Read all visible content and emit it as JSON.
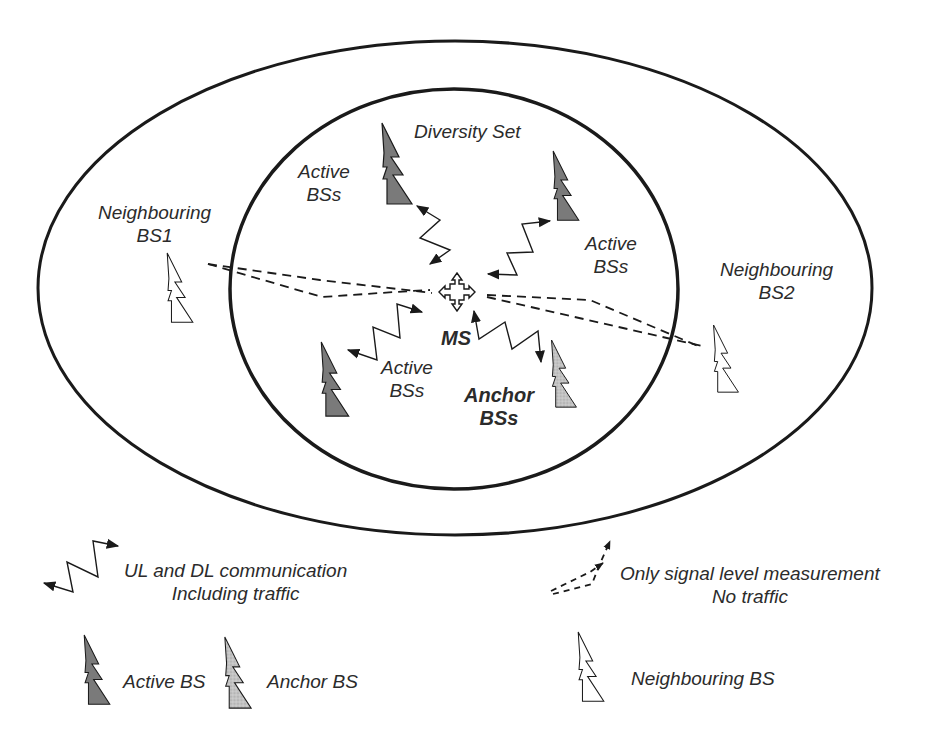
{
  "diagram": {
    "regions": {
      "outer": {
        "label": "Neighbouring area",
        "cx": 455,
        "cy": 288,
        "rx": 417,
        "ry": 247
      },
      "inner": {
        "label": "Diversity Set",
        "cx": 454,
        "cy": 289,
        "rx": 224,
        "ry": 200
      }
    },
    "labels": {
      "diversity_set": "Diversity Set",
      "active_bss_top_left": {
        "line1": "Active",
        "line2": "BSs"
      },
      "active_bss_right": {
        "line1": "Active",
        "line2": "BSs"
      },
      "active_bss_bottom": {
        "line1": "Active",
        "line2": "BSs"
      },
      "anchor_bss": {
        "line1": "Anchor",
        "line2": "BSs"
      },
      "ms": "MS",
      "neighbouring_bs1": {
        "line1": "Neighbouring",
        "line2": "BS1"
      },
      "neighbouring_bs2": {
        "line1": "Neighbouring",
        "line2": "BS2"
      }
    },
    "nodes": [
      {
        "id": "active-bs-top-left",
        "type": "active"
      },
      {
        "id": "active-bs-top-right",
        "type": "active"
      },
      {
        "id": "active-bs-bottom-left",
        "type": "active"
      },
      {
        "id": "anchor-bs",
        "type": "anchor"
      },
      {
        "id": "neighbouring-bs1",
        "type": "neighbouring"
      },
      {
        "id": "neighbouring-bs2",
        "type": "neighbouring"
      },
      {
        "id": "ms",
        "type": "mobile-station"
      }
    ],
    "edges": [
      {
        "from": "ms",
        "to": "active-bs-top-left",
        "style": "zigzag-bidirectional"
      },
      {
        "from": "ms",
        "to": "active-bs-top-right",
        "style": "zigzag-bidirectional"
      },
      {
        "from": "ms",
        "to": "active-bs-bottom-left",
        "style": "zigzag-bidirectional"
      },
      {
        "from": "ms",
        "to": "anchor-bs",
        "style": "zigzag-bidirectional"
      },
      {
        "from": "ms",
        "to": "neighbouring-bs1",
        "style": "dashed"
      },
      {
        "from": "ms",
        "to": "neighbouring-bs2",
        "style": "dashed"
      }
    ]
  },
  "legend": {
    "comm": {
      "line1": "UL and DL communication",
      "line2": "Including traffic"
    },
    "measure": {
      "line1": "Only signal level measurement",
      "line2": "No traffic"
    },
    "active_bs": "Active BS",
    "anchor_bs": "Anchor BS",
    "neighbouring_bs": "Neighbouring BS"
  },
  "colors": {
    "stroke": "#1a1a1a",
    "active_fill": "#7a7a7a",
    "anchor_fill": "#b8b8b8",
    "neighbour_fill": "#ffffff"
  }
}
